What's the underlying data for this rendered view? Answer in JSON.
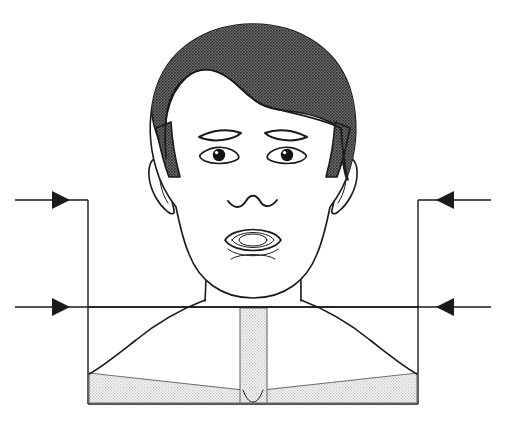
{
  "figure": {
    "title": "Frontal view of head, neck and upper torso with bilateral width measurement arrows",
    "caption": "",
    "canvas": {
      "width": 506,
      "height": 427,
      "background": "#ffffff"
    }
  },
  "palette": {
    "outline": "#1a1a1a",
    "skin": "#ffffff",
    "hair": "#555555",
    "garment": "#dcdcdc",
    "garment_edge": "#6b6b6b",
    "arrow": "#1a1a1a",
    "background": "#ffffff"
  },
  "anatomy": {
    "hair_label": "hair",
    "face_label": "face",
    "left_ear_label": "left ear",
    "right_ear_label": "right ear",
    "left_eyebrow_label": "left eyebrow",
    "right_eyebrow_label": "right eyebrow",
    "left_eye_label": "left eye",
    "right_eye_label": "right eye",
    "nose_label": "nose",
    "mouth_label": "open mouth",
    "chin_label": "chin",
    "neck_label": "neck",
    "left_shoulder_label": "left shoulder",
    "right_shoulder_label": "right shoulder",
    "sternum_band_label": "center placket",
    "left_garment_label": "left garment panel",
    "right_garment_label": "right garment panel",
    "collar_notch_label": "collar notch"
  },
  "measurements": {
    "upper": {
      "label": "upper width measurement",
      "y": 200,
      "left_start_x": 15,
      "left_end_x": 88,
      "right_start_x": 491,
      "right_end_x": 418,
      "left_direction": "right",
      "right_direction": "left"
    },
    "lower": {
      "label": "lower width measurement",
      "y": 307,
      "left_start_x": 15,
      "left_end_x": 105,
      "right_start_x": 491,
      "right_end_x": 401,
      "left_direction": "right",
      "right_direction": "left"
    },
    "bounding_box": {
      "label": "measurement reference box",
      "left_x": 88,
      "right_x": 418,
      "top_y": 200,
      "bottom_y": 404
    }
  }
}
